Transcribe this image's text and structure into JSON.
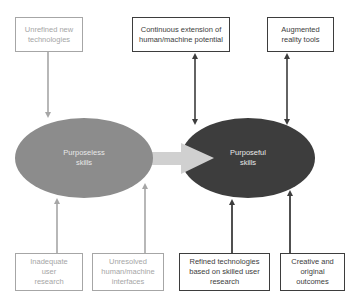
{
  "diagram": {
    "nodes": {
      "purposeless": {
        "label_line1": "Purposeless",
        "label_line2": "skills",
        "color": "#8c8c8c"
      },
      "purposeful": {
        "label_line1": "Purposeful",
        "label_line2": "skills",
        "color": "#3d3d3d"
      }
    },
    "top_boxes": [
      {
        "label": "Unrefined new technologies",
        "style": "light"
      },
      {
        "label": "Continuous extension of human/machine potential",
        "style": "dark"
      },
      {
        "label": "Augmented reality tools",
        "style": "dark"
      }
    ],
    "bottom_boxes": [
      {
        "label": "Inadequate user research",
        "style": "light"
      },
      {
        "label": "Unresolved human/machine interfaces",
        "style": "light"
      },
      {
        "label": "Refined technologies based on skilled user research",
        "style": "dark"
      },
      {
        "label": "Creative and original outcomes",
        "style": "dark"
      }
    ],
    "colors": {
      "light_line": "#a6a6a6",
      "dark_line": "#3d3d3d",
      "transition_arrow": "#d0d0d0"
    }
  }
}
